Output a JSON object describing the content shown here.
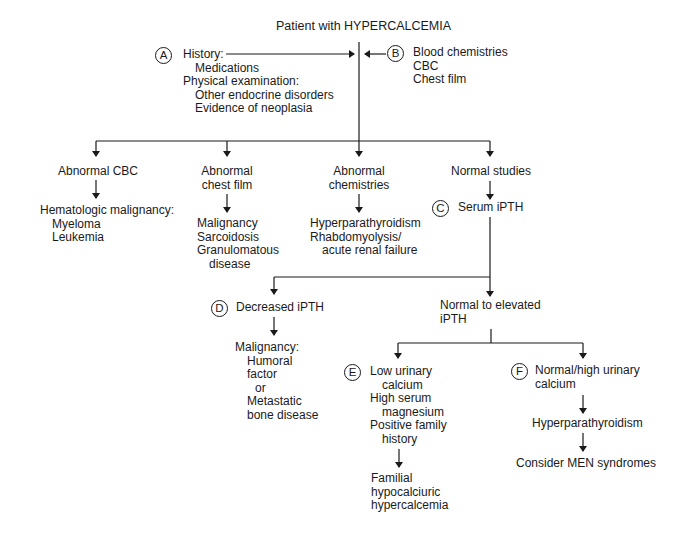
{
  "title": "Patient with HYPERCALCEMIA",
  "nodes": {
    "A": {
      "marker": "A",
      "lines": [
        "History:",
        "Medications",
        "Physical examination:",
        "Other endocrine disorders",
        "Evidence of neoplasia"
      ]
    },
    "B": {
      "marker": "B",
      "lines": [
        "Blood chemistries",
        "CBC",
        "Chest film"
      ]
    },
    "abnormal_cbc": {
      "label": "Abnormal CBC",
      "result_lines": [
        "Hematologic malignancy:",
        "Myeloma",
        "Leukemia"
      ]
    },
    "abnormal_chest_film": {
      "label_lines": [
        "Abnormal",
        "chest film"
      ],
      "result_lines": [
        "Malignancy",
        "Sarcoidosis",
        "Granulomatous",
        "disease"
      ]
    },
    "abnormal_chemistries": {
      "label_lines": [
        "Abnormal",
        "chemistries"
      ],
      "result_lines": [
        "Hyperparathyroidism",
        "Rhabdomyolysis/",
        "acute renal failure"
      ]
    },
    "normal_studies": {
      "label": "Normal studies"
    },
    "C": {
      "marker": "C",
      "label": "Serum iPTH"
    },
    "D": {
      "marker": "D",
      "label": "Decreased iPTH",
      "result_lines": [
        "Malignancy:",
        "Humoral",
        "factor",
        "or",
        "Metastatic",
        "bone disease"
      ]
    },
    "normal_elevated": {
      "label_lines": [
        "Normal to elevated",
        "iPTH"
      ]
    },
    "E": {
      "marker": "E",
      "lines": [
        "Low urinary",
        "calcium",
        "High serum",
        "magnesium",
        "Positive family",
        "history"
      ],
      "result_lines": [
        "Familial",
        "hypocalciuric",
        "hypercalcemia"
      ]
    },
    "F": {
      "marker": "F",
      "lines": [
        "Normal/high urinary",
        "calcium"
      ],
      "next": "Hyperparathyroidism",
      "final": "Consider MEN syndromes"
    }
  },
  "colors": {
    "ink": "#1a1a1a",
    "background": "#ffffff"
  }
}
